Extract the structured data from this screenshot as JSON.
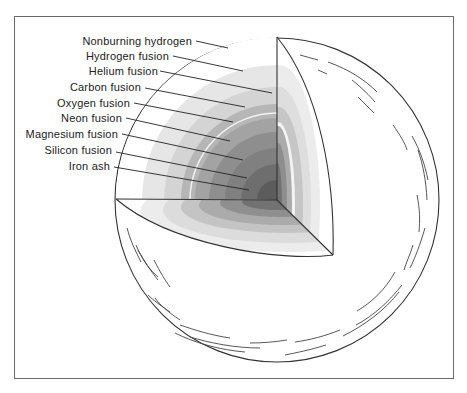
{
  "diagram": {
    "layers": [
      {
        "label": "Nonburning hydrogen",
        "radius": 162,
        "color": "#ffffff"
      },
      {
        "label": "Hydrogen fusion",
        "radius": 135,
        "color": "#e4e4e4"
      },
      {
        "label": "Helium fusion",
        "radius": 113,
        "color": "#d3d3d3"
      },
      {
        "label": "Carbon  fusion",
        "radius": 96,
        "color": "#b4b4b4"
      },
      {
        "label": "Oxygen  fusion",
        "radius": 82,
        "color": "#a2a2a2"
      },
      {
        "label": "Neon  fusion",
        "radius": 68,
        "color": "#8c8c8c"
      },
      {
        "label": "Magnesium  fusion",
        "radius": 52,
        "color": "#7e7e7e"
      },
      {
        "label": "Silicon fusion",
        "radius": 36,
        "color": "#6c6c6c"
      },
      {
        "label": "Iron  ash",
        "radius": 20,
        "color": "#5a5a5a"
      }
    ],
    "outline_color": "#333333"
  }
}
